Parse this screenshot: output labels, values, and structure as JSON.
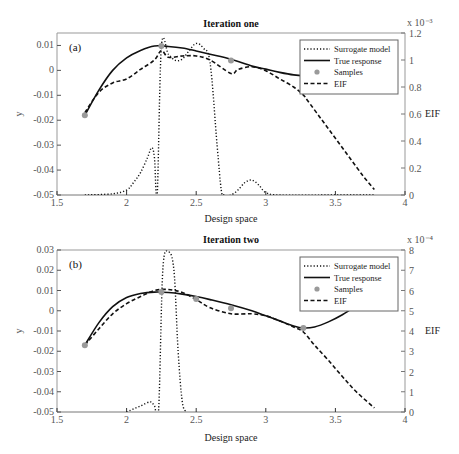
{
  "chart_data": [
    {
      "type": "line",
      "title": "Iteration one",
      "panel_label": "(a)",
      "xlabel": "Design space",
      "ylabel": "y",
      "y2label": "EIF",
      "y2_multiplier": "x 10⁻³",
      "xlim": [
        1.5,
        4
      ],
      "ylim": [
        -0.05,
        0.015
      ],
      "y2lim": [
        0,
        1.2
      ],
      "xticks": [
        "1.5",
        "2",
        "2.5",
        "3",
        "3.5",
        "4"
      ],
      "yticks": [
        "0.01",
        "0",
        "-0.01",
        "-0.02",
        "-0.03",
        "-0.04",
        "-0.05"
      ],
      "y2ticks": [
        "1.2",
        "1",
        "0.8",
        "0.6",
        "0.4",
        "0.2",
        "0"
      ],
      "legend": [
        "Surrogate model",
        "True response",
        "Samples",
        "EIF"
      ],
      "legend_position": "upper right",
      "series": [
        {
          "name": "True response",
          "style": "solid",
          "x": [
            1.7,
            1.8,
            1.9,
            2.0,
            2.1,
            2.2,
            2.3,
            2.4,
            2.5,
            2.6,
            2.75,
            2.9,
            3.0,
            3.1,
            3.2,
            3.3,
            3.4,
            3.5,
            3.6,
            3.7
          ],
          "y": [
            -0.018,
            -0.008,
            0.0,
            0.005,
            0.008,
            0.0098,
            0.0096,
            0.009,
            0.0078,
            0.0065,
            0.0045,
            0.0018,
            0.0005,
            -0.0008,
            -0.0018,
            -0.0022,
            -0.0018,
            -0.0002,
            0.0025,
            0.006
          ]
        },
        {
          "name": "Surrogate model",
          "style": "dotted",
          "axis": "y",
          "x": [
            1.7,
            1.9,
            2.0,
            2.05,
            2.1,
            2.15,
            2.18,
            2.2,
            2.22,
            2.25,
            2.3,
            2.35,
            2.4,
            2.45,
            2.5,
            2.55,
            2.6,
            2.65,
            2.68,
            2.7,
            2.75,
            2.8,
            2.85,
            2.9,
            2.95,
            3.0,
            3.1,
            3.5,
            3.78
          ],
          "y": [
            -0.05,
            -0.0495,
            -0.048,
            -0.045,
            -0.041,
            -0.035,
            -0.031,
            -0.035,
            -0.05,
            0.0095,
            0.0065,
            0.004,
            0.0045,
            0.008,
            0.0108,
            0.009,
            0.003,
            -0.03,
            -0.048,
            -0.05,
            -0.05,
            -0.048,
            -0.045,
            -0.044,
            -0.046,
            -0.049,
            -0.05,
            -0.05,
            -0.05
          ]
        },
        {
          "name": "EIF",
          "style": "dashed",
          "axis": "y2",
          "x": [
            1.7,
            1.8,
            1.9,
            2.0,
            2.1,
            2.2,
            2.25,
            2.3,
            2.4,
            2.5,
            2.6,
            2.75,
            2.8,
            2.9,
            3.0,
            3.1,
            3.2,
            3.27,
            3.3,
            3.4,
            3.5,
            3.6,
            3.7,
            3.78
          ],
          "y": [
            0.61,
            0.76,
            0.83,
            0.86,
            0.93,
            1.0,
            1.07,
            1.02,
            1.03,
            1.03,
            1.0,
            0.9,
            0.93,
            0.95,
            0.92,
            0.86,
            0.8,
            0.74,
            0.7,
            0.56,
            0.42,
            0.28,
            0.14,
            0.04
          ]
        },
        {
          "name": "Samples",
          "style": "markers",
          "x": [
            1.7,
            2.25,
            2.75,
            3.27
          ],
          "y": [
            -0.018,
            0.0098,
            0.004,
            -0.0012
          ]
        }
      ]
    },
    {
      "type": "line",
      "title": "Iteration two",
      "panel_label": "(b)",
      "xlabel": "Design space",
      "ylabel": "y",
      "y2label": "EIF",
      "y2_multiplier": "x 10⁻⁴",
      "xlim": [
        1.5,
        4
      ],
      "ylim": [
        -0.05,
        0.03
      ],
      "y2lim": [
        0,
        8
      ],
      "xticks": [
        "1.5",
        "2",
        "2.5",
        "3",
        "3.5",
        "4"
      ],
      "yticks": [
        "0.03",
        "0.02",
        "0.01",
        "0",
        "-0.01",
        "-0.02",
        "-0.03",
        "-0.04",
        "-0.05"
      ],
      "y2ticks": [
        "8",
        "7",
        "6",
        "5",
        "4",
        "3",
        "2",
        "1",
        "0"
      ],
      "legend": [
        "Surrogate model",
        "True response",
        "Samples",
        "EIF"
      ],
      "legend_position": "upper right",
      "series": [
        {
          "name": "True response",
          "style": "solid",
          "x": [
            1.7,
            1.8,
            1.9,
            2.0,
            2.1,
            2.2,
            2.3,
            2.4,
            2.5,
            2.6,
            2.75,
            2.9,
            3.0,
            3.1,
            3.2,
            3.27,
            3.35,
            3.45,
            3.55,
            3.65,
            3.7
          ],
          "y": [
            -0.017,
            -0.006,
            0.002,
            0.0065,
            0.0085,
            0.0092,
            0.009,
            0.0082,
            0.007,
            0.0055,
            0.003,
            0.0,
            -0.0025,
            -0.005,
            -0.0075,
            -0.0085,
            -0.008,
            -0.0055,
            -0.002,
            0.0025,
            0.005
          ]
        },
        {
          "name": "Surrogate model",
          "style": "dotted",
          "axis": "y",
          "x": [
            2.0,
            2.1,
            2.17,
            2.2,
            2.23,
            2.26,
            2.3,
            2.34,
            2.37,
            2.4,
            2.43
          ],
          "y": [
            -0.05,
            -0.047,
            -0.045,
            -0.047,
            -0.049,
            0.02,
            0.029,
            0.02,
            -0.02,
            -0.045,
            -0.05
          ]
        },
        {
          "name": "EIF",
          "style": "dashed",
          "axis": "y2",
          "x": [
            1.7,
            1.8,
            1.9,
            2.0,
            2.1,
            2.2,
            2.3,
            2.4,
            2.5,
            2.6,
            2.75,
            2.9,
            3.0,
            3.1,
            3.2,
            3.27,
            3.35,
            3.45,
            3.55,
            3.65,
            3.78
          ],
          "y": [
            3.3,
            4.1,
            4.85,
            5.35,
            5.7,
            6.0,
            6.05,
            5.9,
            5.55,
            5.15,
            4.85,
            4.85,
            4.75,
            4.5,
            4.2,
            3.95,
            3.3,
            2.55,
            1.75,
            1.0,
            0.2
          ]
        },
        {
          "name": "Samples",
          "style": "markers",
          "x": [
            1.7,
            2.25,
            2.5,
            2.75,
            3.27
          ],
          "y": [
            -0.017,
            0.0092,
            0.0058,
            0.0012,
            -0.0085
          ]
        }
      ]
    }
  ]
}
